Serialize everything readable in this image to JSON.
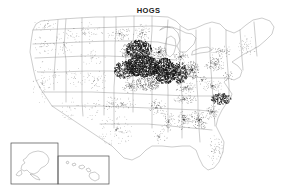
{
  "figure": {
    "title": "HOGS",
    "type": "dot-density-map",
    "region": "United States",
    "background_color": "#ffffff",
    "title_color": "#1a1a1a",
    "boundary_color": "#8a8a8a",
    "dot_color": "#151515",
    "inset_border_color": "#4a4a4a"
  },
  "insets": [
    {
      "name": "alaska-inset",
      "label": ""
    },
    {
      "name": "hawaii-inset",
      "label": ""
    }
  ],
  "chart_data": {
    "type": "scatter",
    "title": "HOGS",
    "xlabel": "",
    "ylabel": "",
    "projection": "albers-usa",
    "grid": false,
    "legend": false,
    "density_scale": [
      {
        "level": "very-high",
        "value": 1.0
      },
      {
        "level": "high",
        "value": 0.72
      },
      {
        "level": "medium",
        "value": 0.4
      },
      {
        "level": "low",
        "value": 0.16
      },
      {
        "level": "very-low",
        "value": 0.04
      }
    ],
    "regions": [
      {
        "name": "Iowa",
        "cx": 143,
        "cy": 66,
        "rx": 17,
        "ry": 11,
        "density": 1.0
      },
      {
        "name": "Illinois",
        "cx": 165,
        "cy": 71,
        "rx": 11,
        "ry": 13,
        "density": 0.93
      },
      {
        "name": "Indiana",
        "cx": 180,
        "cy": 73,
        "rx": 8,
        "ry": 11,
        "density": 0.7
      },
      {
        "name": "Southern Minnesota",
        "cx": 139,
        "cy": 49,
        "rx": 13,
        "ry": 9,
        "density": 0.82
      },
      {
        "name": "Eastern Nebraska",
        "cx": 125,
        "cy": 70,
        "rx": 11,
        "ry": 9,
        "density": 0.62
      },
      {
        "name": "Northern Missouri",
        "cx": 148,
        "cy": 83,
        "rx": 12,
        "ry": 8,
        "density": 0.55
      },
      {
        "name": "Southern Wisconsin",
        "cx": 159,
        "cy": 52,
        "rx": 8,
        "ry": 7,
        "density": 0.45
      },
      {
        "name": "Ohio",
        "cx": 192,
        "cy": 70,
        "rx": 8,
        "ry": 9,
        "density": 0.5
      },
      {
        "name": "Eastern South Dakota",
        "cx": 128,
        "cy": 52,
        "rx": 8,
        "ry": 8,
        "density": 0.42
      },
      {
        "name": "Eastern Kansas",
        "cx": 130,
        "cy": 86,
        "rx": 9,
        "ry": 7,
        "density": 0.3
      },
      {
        "name": "Kentucky",
        "cx": 186,
        "cy": 88,
        "rx": 11,
        "ry": 6,
        "density": 0.26
      },
      {
        "name": "Southern Michigan",
        "cx": 181,
        "cy": 57,
        "rx": 8,
        "ry": 6,
        "density": 0.3
      },
      {
        "name": "Pennsylvania",
        "cx": 215,
        "cy": 64,
        "rx": 11,
        "ry": 7,
        "density": 0.3
      },
      {
        "name": "Eastern North Carolina",
        "cx": 221,
        "cy": 99,
        "rx": 10,
        "ry": 6,
        "density": 0.62
      },
      {
        "name": "Georgia",
        "cx": 199,
        "cy": 120,
        "rx": 10,
        "ry": 10,
        "density": 0.3
      },
      {
        "name": "Alabama",
        "cx": 184,
        "cy": 120,
        "rx": 8,
        "ry": 10,
        "density": 0.26
      },
      {
        "name": "Tennessee",
        "cx": 184,
        "cy": 99,
        "rx": 13,
        "ry": 5,
        "density": 0.25
      },
      {
        "name": "Arkansas",
        "cx": 157,
        "cy": 107,
        "rx": 9,
        "ry": 8,
        "density": 0.22
      },
      {
        "name": "Virginia",
        "cx": 213,
        "cy": 86,
        "rx": 11,
        "ry": 6,
        "density": 0.22
      },
      {
        "name": "South Carolina",
        "cx": 212,
        "cy": 112,
        "rx": 8,
        "ry": 7,
        "density": 0.25
      },
      {
        "name": "New York",
        "cx": 221,
        "cy": 51,
        "rx": 11,
        "ry": 7,
        "density": 0.18
      },
      {
        "name": "Mississippi",
        "cx": 168,
        "cy": 122,
        "rx": 7,
        "ry": 11,
        "density": 0.18
      },
      {
        "name": "Louisiana",
        "cx": 159,
        "cy": 136,
        "rx": 9,
        "ry": 8,
        "density": 0.1
      },
      {
        "name": "Oklahoma",
        "cx": 122,
        "cy": 104,
        "rx": 14,
        "ry": 7,
        "density": 0.12
      },
      {
        "name": "Texas Panhandle",
        "cx": 112,
        "cy": 104,
        "rx": 9,
        "ry": 8,
        "density": 0.1
      },
      {
        "name": "Central Texas",
        "cx": 116,
        "cy": 130,
        "rx": 18,
        "ry": 16,
        "density": 0.07
      },
      {
        "name": "North Dakota",
        "cx": 120,
        "cy": 34,
        "rx": 13,
        "ry": 7,
        "density": 0.16
      },
      {
        "name": "Northern Minnesota",
        "cx": 142,
        "cy": 33,
        "rx": 9,
        "ry": 9,
        "density": 0.18
      },
      {
        "name": "Florida",
        "cx": 215,
        "cy": 150,
        "rx": 8,
        "ry": 16,
        "density": 0.1
      },
      {
        "name": "Colorado",
        "cx": 95,
        "cy": 80,
        "rx": 14,
        "ry": 11,
        "density": 0.07
      },
      {
        "name": "Montana",
        "cx": 85,
        "cy": 33,
        "rx": 20,
        "ry": 11,
        "density": 0.06
      },
      {
        "name": "Wyoming",
        "cx": 92,
        "cy": 58,
        "rx": 14,
        "ry": 9,
        "density": 0.05
      },
      {
        "name": "Idaho",
        "cx": 64,
        "cy": 45,
        "rx": 10,
        "ry": 14,
        "density": 0.05
      },
      {
        "name": "Utah",
        "cx": 74,
        "cy": 78,
        "rx": 9,
        "ry": 11,
        "density": 0.05
      },
      {
        "name": "New Mexico",
        "cx": 92,
        "cy": 108,
        "rx": 11,
        "ry": 12,
        "density": 0.04
      },
      {
        "name": "Arizona",
        "cx": 70,
        "cy": 108,
        "rx": 11,
        "ry": 12,
        "density": 0.04
      },
      {
        "name": "Nevada",
        "cx": 55,
        "cy": 76,
        "rx": 9,
        "ry": 14,
        "density": 0.03
      },
      {
        "name": "Oregon",
        "cx": 42,
        "cy": 46,
        "rx": 13,
        "ry": 10,
        "density": 0.06
      },
      {
        "name": "Washington",
        "cx": 45,
        "cy": 26,
        "rx": 12,
        "ry": 7,
        "density": 0.07
      },
      {
        "name": "California",
        "cx": 42,
        "cy": 83,
        "rx": 10,
        "ry": 22,
        "density": 0.05
      },
      {
        "name": "New England",
        "cx": 246,
        "cy": 45,
        "rx": 11,
        "ry": 11,
        "density": 0.08
      },
      {
        "name": "Maryland-Delaware",
        "cx": 228,
        "cy": 76,
        "rx": 6,
        "ry": 5,
        "density": 0.2
      },
      {
        "name": "West Virginia",
        "cx": 202,
        "cy": 80,
        "rx": 7,
        "ry": 6,
        "density": 0.15
      }
    ]
  }
}
